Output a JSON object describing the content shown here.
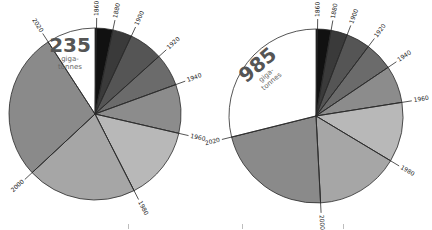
{
  "chart_data": [
    {
      "type": "pie",
      "title": "235 giga-tonnes",
      "total_label": "235",
      "unit_label": [
        "giga-",
        "tonnes"
      ],
      "center": [
        95,
        114
      ],
      "radius": 86,
      "start_angle_deg": 0,
      "direction": "clockwise",
      "categories": [
        "1860",
        "1880",
        "1900",
        "1920",
        "1940",
        "1960",
        "1980",
        "2000",
        "2020"
      ],
      "boundary_angles_deg": [
        0,
        12,
        25,
        48,
        70,
        103,
        153,
        227,
        327,
        360
      ],
      "slices": [
        {
          "label": "1860-1880",
          "start": 0,
          "end": 12,
          "color": "#111111"
        },
        {
          "label": "1880-1900",
          "start": 12,
          "end": 25,
          "color": "#3a3a3a"
        },
        {
          "label": "1900-1920",
          "start": 25,
          "end": 48,
          "color": "#555555"
        },
        {
          "label": "1920-1940",
          "start": 48,
          "end": 70,
          "color": "#6b6b6b"
        },
        {
          "label": "1940-1960",
          "start": 70,
          "end": 103,
          "color": "#8c8c8c"
        },
        {
          "label": "1960-1980",
          "start": 103,
          "end": 153,
          "color": "#b8b8b8"
        },
        {
          "label": "1980-2000",
          "start": 153,
          "end": 227,
          "color": "#a6a6a6"
        },
        {
          "label": "2000-2020",
          "start": 227,
          "end": 327,
          "color": "#8a8a8a"
        },
        {
          "label": "remaining",
          "start": 327,
          "end": 360,
          "color": "#ffffff"
        }
      ],
      "labels": [
        {
          "text": "1860",
          "angle": 1
        },
        {
          "text": "1880",
          "angle": 12
        },
        {
          "text": "1900",
          "angle": 25
        },
        {
          "text": "1920",
          "angle": 48
        },
        {
          "text": "1940",
          "angle": 70
        },
        {
          "text": "1960",
          "angle": 103
        },
        {
          "text": "1980",
          "angle": 153
        },
        {
          "text": "2000",
          "angle": 227
        },
        {
          "text": "2020",
          "angle": 327
        }
      ]
    },
    {
      "type": "pie",
      "title": "985 giga-tonnes",
      "total_label": "985",
      "unit_label": [
        "giga-",
        "tonnes"
      ],
      "center": [
        316,
        116
      ],
      "radius": 87,
      "start_angle_deg": 0,
      "direction": "clockwise",
      "categories": [
        "1860",
        "1880",
        "1900",
        "1920",
        "1940",
        "1960",
        "1980",
        "2000",
        "2020"
      ],
      "boundary_angles_deg": [
        0,
        10,
        21,
        37,
        56,
        81,
        121,
        177,
        256,
        360
      ],
      "slices": [
        {
          "label": "1860-1880",
          "start": 0,
          "end": 10,
          "color": "#111111"
        },
        {
          "label": "1880-1900",
          "start": 10,
          "end": 21,
          "color": "#3a3a3a"
        },
        {
          "label": "1900-1920",
          "start": 21,
          "end": 37,
          "color": "#555555"
        },
        {
          "label": "1920-1940",
          "start": 37,
          "end": 56,
          "color": "#6b6b6b"
        },
        {
          "label": "1940-1960",
          "start": 56,
          "end": 81,
          "color": "#8c8c8c"
        },
        {
          "label": "1960-1980",
          "start": 81,
          "end": 121,
          "color": "#b8b8b8"
        },
        {
          "label": "1980-2000",
          "start": 121,
          "end": 177,
          "color": "#a6a6a6"
        },
        {
          "label": "2000-2020",
          "start": 177,
          "end": 256,
          "color": "#8a8a8a"
        },
        {
          "label": "remaining",
          "start": 256,
          "end": 360,
          "color": "#ffffff"
        }
      ],
      "labels": [
        {
          "text": "1860",
          "angle": 1
        },
        {
          "text": "1880",
          "angle": 10
        },
        {
          "text": "1900",
          "angle": 21
        },
        {
          "text": "1920",
          "angle": 37
        },
        {
          "text": "1940",
          "angle": 56
        },
        {
          "text": "1960",
          "angle": 81
        },
        {
          "text": "1980",
          "angle": 121
        },
        {
          "text": "2000",
          "angle": 177
        },
        {
          "text": "2020",
          "angle": 256
        }
      ]
    }
  ],
  "style": {
    "outline_color": "#2a2a2a",
    "label_color": "#222222",
    "total_color": "#555555",
    "unit_color": "#666666"
  }
}
